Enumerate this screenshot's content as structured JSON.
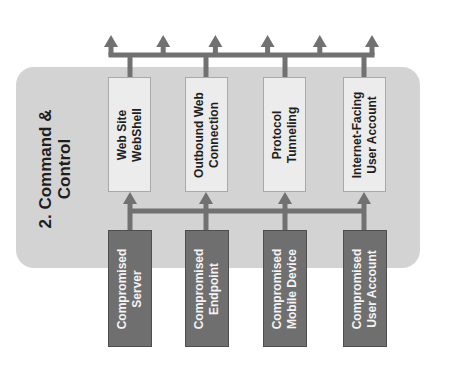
{
  "diagram": {
    "title": "2. Command & Control",
    "title_lines": [
      "2. Command &",
      "Control"
    ],
    "channels": [
      {
        "id": "web-site-webshell",
        "lines": [
          "Web Site",
          "WebShell"
        ]
      },
      {
        "id": "outbound-web-connection",
        "lines": [
          "Outbound Web",
          "Connection"
        ]
      },
      {
        "id": "protocol-tunneling",
        "lines": [
          "Protocol",
          "Tunneling"
        ]
      },
      {
        "id": "internet-facing-user-account",
        "lines": [
          "Internet-Facing",
          "User Account"
        ]
      }
    ],
    "sources": [
      {
        "id": "compromised-server",
        "lines": [
          "Compromised",
          "Server"
        ]
      },
      {
        "id": "compromised-endpoint",
        "lines": [
          "Compromised",
          "Endpoint"
        ]
      },
      {
        "id": "compromised-mobile-device",
        "lines": [
          "Compromised",
          "Mobile Device"
        ]
      },
      {
        "id": "compromised-user-account",
        "lines": [
          "Compromised",
          "User Account"
        ]
      }
    ],
    "outbound_arrow_count": 6,
    "edges": [
      {
        "from": "sources-bus",
        "to": "channels",
        "type": "arrow-up"
      },
      {
        "from": "channels",
        "to": "outbound-bus",
        "type": "line"
      },
      {
        "from": "outbound-bus",
        "to": "external",
        "type": "arrow-up",
        "count": 6
      }
    ],
    "colors": {
      "panel": "#d3d3d3",
      "channel_box": "#ececec",
      "source_box": "#6f6f6f",
      "connector": "#717171",
      "title_text": "#1e1e1e",
      "source_text": "#f4f4f4"
    }
  }
}
